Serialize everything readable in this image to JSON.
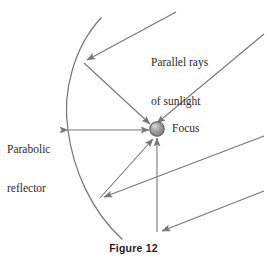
{
  "figure": {
    "caption": "Figure 12",
    "labels": {
      "parallel_rays_line1": "Parallel rays",
      "parallel_rays_line2": "of sunlight",
      "parabolic_line1": "Parabolic",
      "parabolic_line2": "reflector",
      "focus": "Focus"
    },
    "colors": {
      "stroke": "#77777a",
      "text": "#2b2b2b",
      "caption": "#1f1f1f",
      "focus_fill": "#9a9a9a",
      "focus_edge": "#5d5d5d",
      "focus_highlight": "#c9c9c9",
      "background": "#ffffff"
    },
    "geometry": {
      "focus_point": {
        "x": 157,
        "y": 129,
        "r": 7.2
      },
      "vertex_point": {
        "x": 68,
        "y": 130
      },
      "parabola_top_end": {
        "x": 101,
        "y": 18
      },
      "parabola_bottom_end": {
        "x": 122,
        "y": 239
      },
      "ray_slope": -0.42
    },
    "incoming_rays": [
      {
        "name": "ray-1",
        "from_x": 176,
        "from_y": 12,
        "to_x": 84,
        "to_y": 62
      },
      {
        "name": "ray-2",
        "from_x": 262,
        "from_y": 35,
        "to_x": 154,
        "to_y": 125
      },
      {
        "name": "ray-3",
        "from_x": 262,
        "from_y": 136,
        "to_x": 101,
        "to_y": 198
      },
      {
        "name": "ray-4",
        "from_x": 262,
        "from_y": 192,
        "to_x": 160,
        "to_y": 232
      }
    ],
    "reflected_rays": [
      {
        "name": "reflected-ray-top",
        "from_x": 84,
        "from_y": 62,
        "to_x": 151,
        "to_y": 124
      },
      {
        "name": "reflected-ray-axis",
        "from_x": 68,
        "from_y": 130,
        "to_x": 150,
        "to_y": 130
      },
      {
        "name": "reflected-ray-lower",
        "from_x": 101,
        "from_y": 198,
        "to_x": 154,
        "to_y": 138
      },
      {
        "name": "reflected-ray-vertical",
        "from_x": 157,
        "from_y": 232,
        "to_x": 157,
        "to_y": 139
      }
    ]
  }
}
